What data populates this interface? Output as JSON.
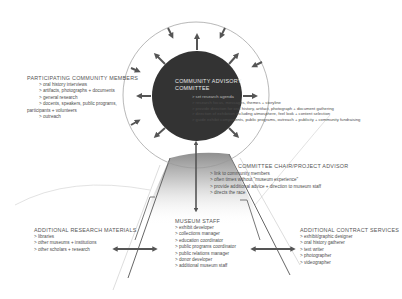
{
  "diagram": {
    "center_node": {
      "title_line1": "COMMUNITY ADVISORY",
      "title_line2": "COMMITTEE",
      "items": [
        "set research agenda",
        "research focus, messages, themes + storyline",
        "provide direction for oral history, artifact, photograph + document gathering",
        "direction of exhibition including atmosphere, feel look + content selection",
        "guide exhibit components, public programs, outreach + publicity + community fundraising"
      ]
    },
    "participating": {
      "title": "PARTICIPATING COMMUNITY MEMBERS",
      "items": [
        "oral history interviews",
        "artifacts, photographs + documents",
        "general research",
        "docents, speakers, public programs,"
      ],
      "continuation": "participants + volunteers",
      "items_after": [
        "outreach"
      ]
    },
    "chair": {
      "title": "COMMITTEE CHAIR/PROJECT ADVISOR",
      "items": [
        "link to community members",
        "often times without \"museum experience\"",
        "provide additional advice + direction to museum staff",
        "directs the race"
      ]
    },
    "research": {
      "title": "ADDITIONAL RESEARCH MATERIALS",
      "items": [
        "libraries",
        "other museums + institutions",
        "other scholars + research"
      ]
    },
    "staff": {
      "title": "MUSEUM STAFF",
      "items": [
        "exhibit developer",
        "collections manager",
        "education coordinator",
        "public programs coordinator",
        "public relations manager",
        "donor developer",
        "additional museum staff"
      ]
    },
    "contract": {
      "title": "ADDITIONAL CONTRACT SERVICES",
      "items": [
        "exhibit/graphic designer",
        "oral history gatherer",
        "text writer",
        "photographer",
        "videographer"
      ]
    },
    "colors": {
      "inner_circle": "#333333",
      "arrows": "#555555",
      "outline": "#888888",
      "funnel_top": "#9a9a9a",
      "funnel_bottom": "#ffffff"
    }
  }
}
